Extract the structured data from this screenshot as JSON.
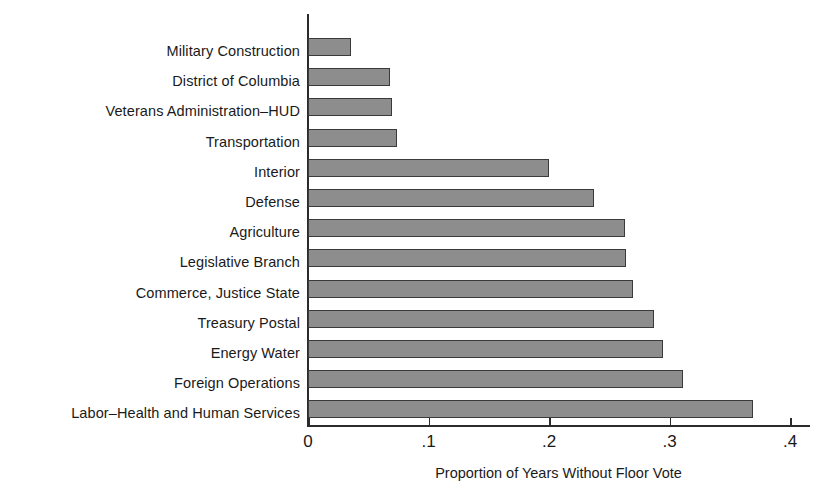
{
  "chart_data": {
    "type": "bar",
    "orientation": "horizontal",
    "title": "",
    "xlabel": "Proportion of Years Without Floor Vote",
    "ylabel": "",
    "xlim": [
      0,
      0.4
    ],
    "xticks": [
      0,
      0.1,
      0.2,
      0.3,
      0.4
    ],
    "xtick_labels": [
      "0",
      ".1",
      ".2",
      ".3",
      ".4"
    ],
    "grid": false,
    "legend": null,
    "bar_color": "#8d8d8d",
    "bar_edge_color": "#3a3a3a",
    "categories": [
      "Military Construction",
      "District of Columbia",
      "Veterans Administration–HUD",
      "Transportation",
      "Interior",
      "Defense",
      "Agriculture",
      "Legislative Branch",
      "Commerce, Justice State",
      "Treasury Postal",
      "Energy Water",
      "Foreign Operations",
      "Labor–Health and Human Services"
    ],
    "values": [
      0.036,
      0.068,
      0.07,
      0.074,
      0.2,
      0.237,
      0.263,
      0.264,
      0.27,
      0.287,
      0.295,
      0.311,
      0.369
    ]
  }
}
